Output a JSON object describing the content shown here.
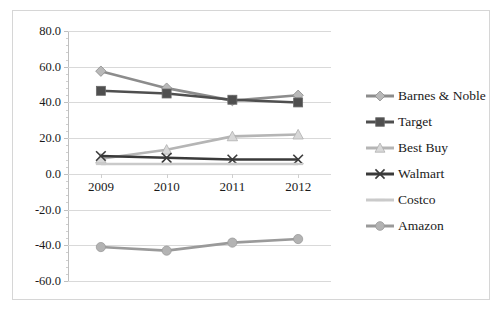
{
  "chart_data": {
    "type": "line",
    "title": "",
    "xlabel": "",
    "ylabel": "",
    "categories": [
      "2009",
      "2010",
      "2011",
      "2012"
    ],
    "ylim": [
      -60,
      80
    ],
    "ytick_labels": [
      "80.0",
      "60.0",
      "40.0",
      "20.0",
      "0.0",
      "-20.0",
      "-40.0",
      "-60.0"
    ],
    "ytick_values": [
      80,
      60,
      40,
      20,
      0,
      -20,
      -40,
      -60
    ],
    "grid": true,
    "legend_position": "right",
    "series": [
      {
        "name": "Barnes & Noble",
        "values": [
          57.5,
          48.0,
          41.0,
          44.0
        ],
        "color": "#8c8c8c",
        "marker": "diamond"
      },
      {
        "name": "Target",
        "values": [
          46.5,
          45.0,
          41.5,
          40.0
        ],
        "color": "#4f4f4f",
        "marker": "square"
      },
      {
        "name": "Best Buy",
        "values": [
          8.5,
          13.5,
          21.0,
          22.0
        ],
        "color": "#b5b5b5",
        "marker": "triangle"
      },
      {
        "name": "Walmart",
        "values": [
          10.0,
          9.0,
          8.0,
          8.0
        ],
        "color": "#3a3a3a",
        "marker": "cross"
      },
      {
        "name": "Costco",
        "values": [
          5.5,
          5.5,
          5.5,
          5.5
        ],
        "color": "#cacaca",
        "marker": "dash"
      },
      {
        "name": "Amazon",
        "values": [
          -41.0,
          -43.0,
          -38.5,
          -36.5
        ],
        "color": "#9a9a9a",
        "marker": "circle"
      }
    ]
  },
  "legend": {
    "items": [
      {
        "label": "Barnes & Noble"
      },
      {
        "label": "Target"
      },
      {
        "label": "Best Buy"
      },
      {
        "label": "Walmart"
      },
      {
        "label": "Costco"
      },
      {
        "label": "Amazon"
      }
    ]
  }
}
